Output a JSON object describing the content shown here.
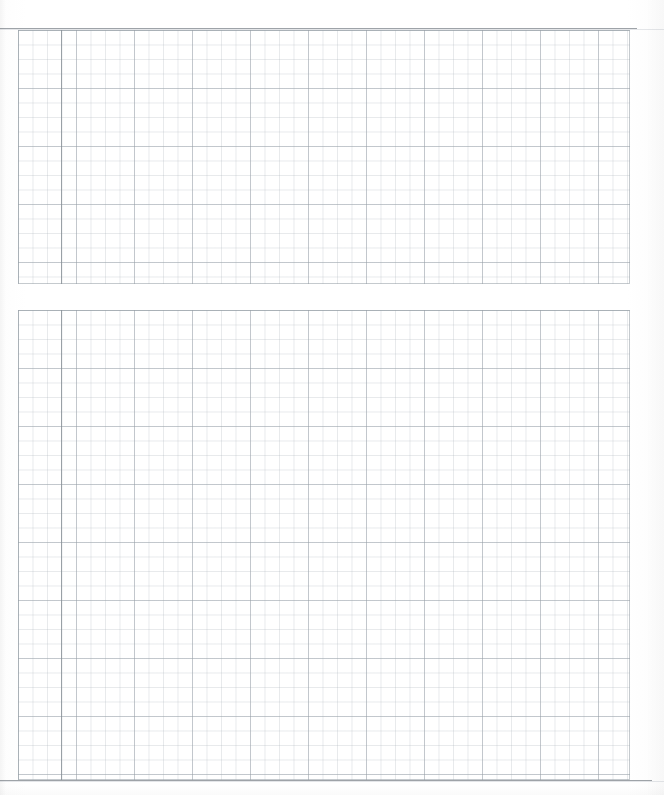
{
  "document": {
    "kind": "blank-graph-paper-scan",
    "title": "",
    "page_background": "#ffffff",
    "width_px": 664,
    "height_px": 795,
    "visible_text": "",
    "notes": ""
  },
  "rules": {
    "top_rule_color": "#9ea3a8",
    "bottom_rule_color": "#9ea3a8",
    "margin_rule_color": "#889098"
  },
  "grid": {
    "minor_color": "#b2b9c0",
    "major_color": "#969ea6",
    "minor_pitch_px": 14.5,
    "major_every_cells": 4
  },
  "panels": [
    {
      "name": "upper-grid",
      "label": "",
      "x": 18,
      "y": 30,
      "width": 612,
      "height": 254,
      "columns": 42,
      "rows": 17
    },
    {
      "name": "lower-grid",
      "label": "",
      "x": 18,
      "y": 310,
      "width": 612,
      "height": 470,
      "columns": 42,
      "rows": 32
    }
  ],
  "chart_data": {
    "type": "table",
    "title": "",
    "subtitle": "",
    "xlabel": "",
    "ylabel": "",
    "categories": [],
    "values": [],
    "annotations": [],
    "legend": [],
    "grid": true
  },
  "accessibility": {
    "caption": "Blank graph paper sheet with two ruled grid panels"
  }
}
